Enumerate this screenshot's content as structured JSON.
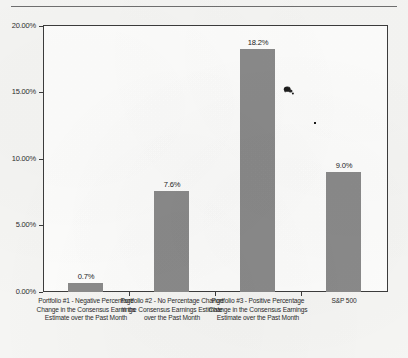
{
  "chart_data": {
    "type": "bar",
    "title": "",
    "subtitle": "",
    "xlabel": "",
    "ylabel": "",
    "ylim": [
      0,
      20
    ],
    "ytick_labels": [
      "0.00%",
      "5.00%",
      "10.00%",
      "15.00%",
      "20.00%"
    ],
    "ytick_values": [
      0,
      5,
      10,
      15,
      20
    ],
    "grid": false,
    "legend": null,
    "categories": [
      "Portfolio #1 - Negative Percentage Change in the Consensus Earnings Estimate over the Past Month",
      "Portfolio #2 - No Percentage Change in the Consensus Earnings Estimate over the Past Month",
      "Portfolio #3 - Positive Percentage Change in the Consensus Earnings Estimate over the Past Month",
      "S&P 500"
    ],
    "values": [
      0.7,
      7.6,
      18.2,
      9.0
    ],
    "value_labels": [
      "0.7%",
      "7.6%",
      "18.2%",
      "9.0%"
    ],
    "bar_color": "#8a8a8a",
    "axis_color": "#3c3c3c",
    "background_color": "#f5f5f3",
    "plot_background_color": "#fdfdfc"
  },
  "artifacts": {
    "smudge_label": "scan-ink-smudge",
    "speck_label": "scan-ink-speck"
  }
}
